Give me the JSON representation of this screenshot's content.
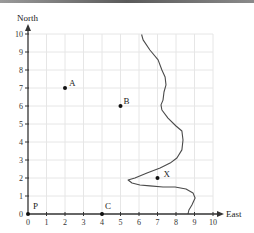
{
  "chart_data": {
    "type": "scatter",
    "title": "",
    "xlabel": "East",
    "ylabel": "North",
    "xlim": [
      0,
      10
    ],
    "ylim": [
      0,
      10
    ],
    "grid": true,
    "x_ticks": [
      "0",
      "1",
      "2",
      "3",
      "4",
      "5",
      "6",
      "7",
      "8",
      "9",
      "10"
    ],
    "y_ticks": [
      "0",
      "1",
      "2",
      "3",
      "4",
      "5",
      "6",
      "7",
      "8",
      "9",
      "10"
    ],
    "points": [
      {
        "label": "A",
        "x": 2,
        "y": 7
      },
      {
        "label": "B",
        "x": 5,
        "y": 6
      },
      {
        "label": "X",
        "x": 7,
        "y": 2
      },
      {
        "label": "P",
        "x": 0,
        "y": 0
      },
      {
        "label": "C",
        "x": 4,
        "y": 0
      }
    ],
    "series": [
      {
        "name": "boundary-curve",
        "type": "line",
        "points": [
          [
            6.14,
            9.97
          ],
          [
            6.22,
            9.67
          ],
          [
            6.59,
            9.11
          ],
          [
            7.03,
            8.56
          ],
          [
            7.24,
            8.0
          ],
          [
            7.41,
            7.61
          ],
          [
            7.46,
            7.17
          ],
          [
            7.35,
            6.78
          ],
          [
            7.3,
            6.33
          ],
          [
            7.19,
            6.06
          ],
          [
            7.24,
            5.78
          ],
          [
            7.57,
            5.33
          ],
          [
            8.0,
            4.89
          ],
          [
            8.32,
            4.61
          ],
          [
            8.38,
            4.11
          ],
          [
            8.32,
            3.56
          ],
          [
            8.05,
            3.11
          ],
          [
            7.68,
            2.83
          ],
          [
            7.14,
            2.56
          ],
          [
            6.43,
            2.28
          ],
          [
            5.78,
            2.0
          ],
          [
            5.41,
            1.89
          ],
          [
            5.62,
            1.72
          ],
          [
            6.05,
            1.61
          ],
          [
            6.59,
            1.56
          ],
          [
            7.3,
            1.5
          ],
          [
            7.95,
            1.5
          ],
          [
            8.54,
            1.39
          ],
          [
            8.92,
            1.17
          ],
          [
            9.03,
            0.89
          ],
          [
            8.86,
            0.5
          ],
          [
            8.7,
            0.22
          ],
          [
            8.65,
            0.0
          ]
        ]
      }
    ]
  },
  "axes": {
    "x_label": "East",
    "y_label": "North"
  },
  "colors": {
    "axis": "#333333",
    "grid": "#e6e6e6",
    "curve": "#4a4a4a",
    "point": "#111111"
  }
}
